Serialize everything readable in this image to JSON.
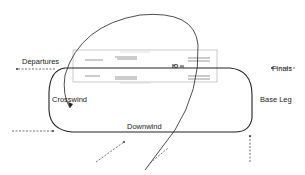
{
  "diagram": {
    "type": "airport traffic pattern",
    "labels": {
      "departures": "Departures",
      "finals": "Finals",
      "crosswind": "Crosswind",
      "downwind": "Downwind",
      "base_leg": "Base Leg",
      "runway_marking": "Ю ∞"
    },
    "colors": {
      "line": "#222222",
      "runway_outline": "#aaaaaa",
      "runway_marks": "#999999"
    }
  }
}
